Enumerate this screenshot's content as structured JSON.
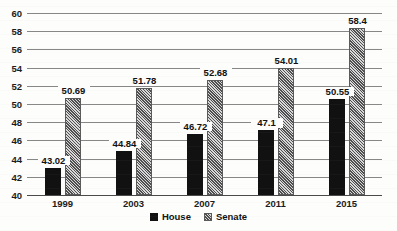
{
  "chart_data": {
    "type": "bar",
    "title": "",
    "subtitle": "",
    "xlabel": "",
    "ylabel": "",
    "categories": [
      "1999",
      "2003",
      "2007",
      "2011",
      "2015"
    ],
    "series": [
      {
        "name": "House",
        "values": [
          43.02,
          44.84,
          46.72,
          47.1,
          50.55
        ],
        "labels": [
          "43.02",
          "44.84",
          "46.72",
          "47.1",
          "50.55"
        ],
        "color": "#111111",
        "pattern": "solid"
      },
      {
        "name": "Senate",
        "values": [
          50.69,
          51.78,
          52.68,
          54.01,
          58.4
        ],
        "labels": [
          "50.69",
          "51.78",
          "52.68",
          "54.01",
          "58.4"
        ],
        "color": "#808080",
        "pattern": "diagonal-hatch"
      }
    ],
    "ylim": [
      40,
      60
    ],
    "yticks": [
      40,
      42,
      44,
      46,
      48,
      50,
      52,
      54,
      56,
      58,
      60
    ],
    "ytick_labels": [
      "40",
      "42",
      "44",
      "46",
      "48",
      "50",
      "52",
      "54",
      "56",
      "58",
      "60"
    ],
    "grid": true,
    "grid_axis": "y",
    "legend": [
      "House",
      "Senate"
    ],
    "legend_position": "bottom",
    "data_labels_shown": true
  }
}
